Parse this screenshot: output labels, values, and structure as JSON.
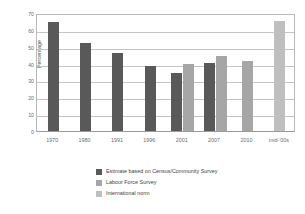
{
  "chart_data": {
    "type": "bar",
    "title": "",
    "subtitle": "",
    "xlabel": "",
    "ylabel": "Percentage",
    "ylim": [
      0,
      70
    ],
    "ytick_step": 10,
    "yticks": [
      70,
      60,
      50,
      40,
      30,
      20,
      10,
      0
    ],
    "grid": true,
    "grid_axis": "y",
    "legend_position": "bottom",
    "categories": [
      "1970",
      "1980",
      "1991",
      "1996",
      "2001",
      "2007",
      "2010",
      "mid-'00s"
    ],
    "series": [
      {
        "name": "Estimate based on Census/Community Survey",
        "color": "#595959",
        "values": [
          64.5,
          52.5,
          46.0,
          38.5,
          34.5,
          40.5,
          null,
          null
        ]
      },
      {
        "name": "Labour Force Survey",
        "color": "#a6a6a6",
        "values": [
          null,
          null,
          null,
          null,
          40.0,
          44.5,
          41.5,
          null
        ]
      },
      {
        "name": "International norm",
        "color": "#bfbfbf",
        "values": [
          null,
          null,
          null,
          null,
          null,
          null,
          null,
          65.0
        ]
      }
    ]
  },
  "legend": {
    "items": [
      {
        "label": "Estimate based on Census/Community Survey",
        "color": "#595959"
      },
      {
        "label": "Labour Force Survey",
        "color": "#a6a6a6"
      },
      {
        "label": "International norm",
        "color": "#bfbfbf"
      }
    ]
  },
  "axis": {
    "y_title": "Percentage"
  }
}
